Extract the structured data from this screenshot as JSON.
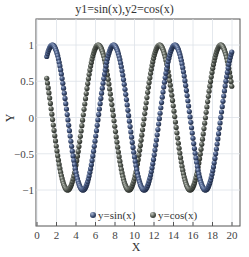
{
  "chart_data": {
    "type": "scatter",
    "title": "y1=sin(x),y2=cos(x)",
    "xlabel": "X",
    "ylabel": "Y",
    "xlim": [
      0,
      21
    ],
    "ylim": [
      -1.5,
      1.36
    ],
    "xticks": [
      0,
      2,
      4,
      6,
      8,
      10,
      12,
      14,
      16,
      18,
      20
    ],
    "yticks": [
      -1,
      -0.5,
      0,
      0.5,
      1
    ],
    "grid": true,
    "legend_position": "lower center (inside)",
    "x_range": {
      "start": 1,
      "end": 20,
      "step": 0.075
    },
    "series": [
      {
        "name": "y=sin(x)",
        "formula": "sin(x)",
        "color": "#34466a",
        "marker": "sphere",
        "x": [
          1,
          2,
          3,
          4,
          5,
          6,
          7,
          8,
          9,
          10,
          11,
          12,
          13,
          14,
          15,
          16,
          17,
          18,
          19,
          20
        ],
        "values": [
          0.841,
          0.909,
          0.141,
          -0.757,
          -0.959,
          -0.279,
          0.657,
          0.989,
          0.412,
          -0.544,
          -1.0,
          -0.537,
          0.42,
          0.991,
          0.65,
          -0.288,
          -0.961,
          -0.751,
          0.15,
          0.913
        ]
      },
      {
        "name": "y=cos(x)",
        "formula": "cos(x)",
        "color": "#4a5048",
        "marker": "sphere",
        "x": [
          1,
          2,
          3,
          4,
          5,
          6,
          7,
          8,
          9,
          10,
          11,
          12,
          13,
          14,
          15,
          16,
          17,
          18,
          19,
          20
        ],
        "values": [
          0.54,
          -0.416,
          -0.99,
          -0.654,
          0.284,
          0.96,
          0.754,
          -0.146,
          -0.911,
          -0.839,
          0.004,
          0.844,
          0.907,
          0.137,
          -0.76,
          -0.958,
          -0.275,
          0.66,
          0.989,
          0.408
        ]
      }
    ]
  },
  "ticks": {
    "x": [
      "0",
      "2",
      "4",
      "6",
      "8",
      "10",
      "12",
      "14",
      "16",
      "18",
      "20"
    ],
    "y": [
      "1",
      "0.5",
      "0",
      "−0.5",
      "−1"
    ]
  },
  "legend": {
    "sin_label": "y=sin(x)",
    "cos_label": "y=cos(x)"
  }
}
